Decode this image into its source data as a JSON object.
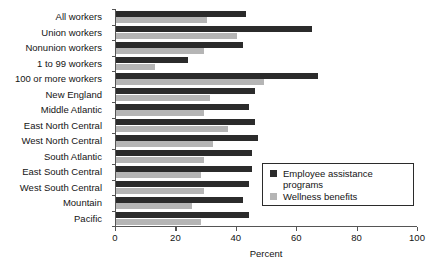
{
  "chart_data": {
    "type": "bar",
    "orientation": "horizontal",
    "title": "",
    "xlabel": "Percent",
    "ylabel": "",
    "xlim": [
      0,
      100
    ],
    "xticks": [
      0,
      20,
      40,
      60,
      80,
      100
    ],
    "grid": false,
    "legend_position": "lower right",
    "categories": [
      "All workers",
      "Union workers",
      "Nonunion workers",
      "1 to 99 workers",
      "100 or more workers",
      "New England",
      "Middle Atlantic",
      "East North Central",
      "West North Central",
      "South Atlantic",
      "East South Central",
      "West South Central",
      "Mountain",
      "Pacific"
    ],
    "series": [
      {
        "name": "Employee assistance programs",
        "color": "#2b2b2b",
        "values": [
          43,
          65,
          42,
          24,
          67,
          46,
          44,
          46,
          47,
          45,
          45,
          44,
          42,
          44
        ]
      },
      {
        "name": "Wellness benefits",
        "color": "#b5b5b5",
        "values": [
          30,
          40,
          29,
          13,
          49,
          31,
          29,
          37,
          32,
          29,
          28,
          29,
          25,
          28
        ]
      }
    ]
  },
  "axis": {
    "tick_labels": [
      "0",
      "20",
      "40",
      "60",
      "80",
      "100"
    ],
    "x_axis_title": "Percent"
  },
  "legend": {
    "entries": [
      {
        "label": "Employee assistance programs",
        "color": "#2b2b2b"
      },
      {
        "label": "Wellness benefits",
        "color": "#b5b5b5"
      }
    ]
  }
}
